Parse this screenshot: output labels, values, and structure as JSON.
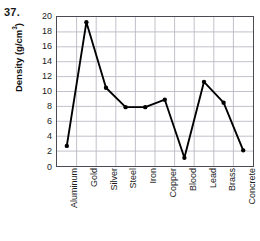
{
  "problem": {
    "number": "37."
  },
  "chart_data": {
    "type": "line",
    "title": "",
    "xlabel": "",
    "ylabel": "Density (g/cm3)",
    "ylabel_base": "Density (g/cm",
    "ylabel_sup": "3",
    "ylabel_tail": ")",
    "categories": [
      "Aluminum",
      "Gold",
      "Silver",
      "Steel",
      "Iron",
      "Copper",
      "Blood",
      "Lead",
      "Brass",
      "Concrete"
    ],
    "values": [
      2.7,
      19.3,
      10.5,
      7.9,
      7.9,
      8.9,
      1.1,
      11.3,
      8.5,
      2.1
    ],
    "series": [
      {
        "name": "Density",
        "values": [
          2.7,
          19.3,
          10.5,
          7.9,
          7.9,
          8.9,
          1.1,
          11.3,
          8.5,
          2.1
        ]
      }
    ],
    "ylim": [
      0,
      20
    ],
    "ytick_step": 2,
    "yticks": [
      20,
      18,
      16,
      14,
      12,
      10,
      8,
      6,
      4,
      2,
      0
    ],
    "grid": true,
    "grid_x": true,
    "grid_y": true,
    "legend": false,
    "legend_position": "none",
    "marker": "circle",
    "line_color": "#000000",
    "marker_color": "#000000",
    "grid_color": "#b9b9c4",
    "axis_color": "#4a4a55"
  }
}
